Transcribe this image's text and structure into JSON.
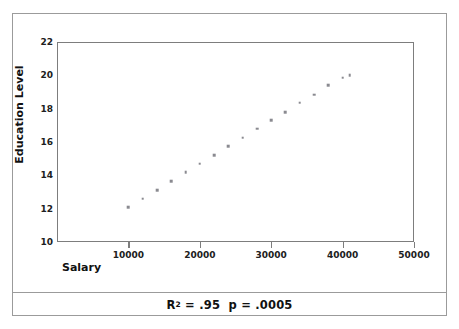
{
  "figure": {
    "caption_prefix": "R",
    "caption_exponent": "2",
    "caption_rest": " = .95  p = .0005",
    "caption_full": "R2 = .95  p = .0005"
  },
  "chart_data": {
    "type": "scatter",
    "title": "",
    "xlabel": "Salary",
    "ylabel": "Education Level",
    "xlim": [
      0,
      50000
    ],
    "ylim": [
      10,
      22
    ],
    "xticks": [
      10000,
      20000,
      30000,
      40000,
      50000
    ],
    "xtick_labels": [
      "10000",
      "20000",
      "30000",
      "40000",
      "50000"
    ],
    "yticks": [
      10,
      12,
      14,
      16,
      18,
      20,
      22
    ],
    "ytick_labels": [
      "10",
      "12",
      "14",
      "16",
      "18",
      "20",
      "22"
    ],
    "grid": false,
    "legend": null,
    "marker": {
      "shape": "square",
      "color": "#8a8a90",
      "size_px": 2.6
    },
    "annotations": [
      {
        "text": "R2 = .95  p = .0005",
        "position": "below-axes-center"
      }
    ],
    "series": [
      {
        "name": "Education Level vs Salary",
        "x": [
          10000,
          12000,
          14000,
          16000,
          18000,
          20000,
          22000,
          24000,
          26000,
          28000,
          30000,
          32000,
          34000,
          36000,
          38000,
          40000,
          41000
        ],
        "y": [
          12.1,
          12.6,
          13.1,
          13.65,
          14.2,
          14.7,
          15.2,
          15.75,
          16.25,
          16.8,
          17.3,
          17.8,
          18.35,
          18.85,
          19.4,
          19.85,
          20.0
        ]
      }
    ]
  }
}
